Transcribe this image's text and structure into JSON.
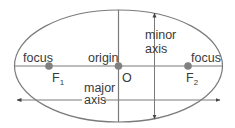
{
  "diagram": {
    "colors": {
      "line": "#7a7a7a",
      "point": "#808080",
      "text": "#3a3a3a"
    },
    "labels": {
      "focus_left": "focus",
      "focus_right": "focus",
      "origin": "origin",
      "origin_point": "O",
      "f1": "F",
      "f1_sub": "1",
      "f2": "F",
      "f2_sub": "2",
      "minor_axis_line1": "minor",
      "minor_axis_line2": "axis",
      "major_axis_line1": "major",
      "major_axis_line2": "axis"
    },
    "points": [
      {
        "name": "F1",
        "x": 49,
        "y": 66
      },
      {
        "name": "O",
        "x": 118,
        "y": 66
      },
      {
        "name": "F2",
        "x": 188,
        "y": 66
      }
    ]
  }
}
